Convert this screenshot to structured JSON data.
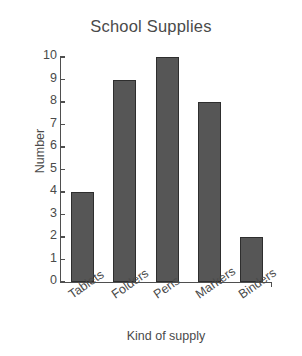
{
  "chart_data": {
    "type": "bar",
    "title": "School Supplies",
    "xlabel": "Kind of supply",
    "ylabel": "Number",
    "categories": [
      "Tablets",
      "Folders",
      "Pens",
      "Markers",
      "Binders"
    ],
    "values": [
      4,
      9,
      10,
      8,
      2
    ],
    "ylim": [
      0,
      10
    ],
    "ytick_labels": [
      "0",
      "1",
      "2",
      "3",
      "4",
      "5",
      "6",
      "7",
      "8",
      "9",
      "10"
    ],
    "ytick_values": [
      0,
      1,
      2,
      3,
      4,
      5,
      6,
      7,
      8,
      9,
      10
    ],
    "grid": false,
    "legend": null,
    "bar_color": "#565656",
    "bar_edge_color": "#2e2e2e",
    "axis_color": "#4f4f4f",
    "text_color": "#4a4a4a",
    "background_color": "#ffffff",
    "xtick_label_rotation": -35
  }
}
